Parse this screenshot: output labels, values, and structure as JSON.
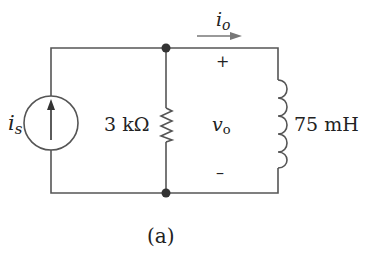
{
  "figure": {
    "caption": "(a)",
    "components": {
      "source": {
        "type": "current-source",
        "label_main": "i",
        "label_sub": "s",
        "direction": "up"
      },
      "resistor": {
        "type": "resistor",
        "label": "3 kΩ"
      },
      "inductor": {
        "type": "inductor",
        "label": "75 mH"
      }
    },
    "current_label": {
      "main": "i",
      "sub": "o"
    },
    "voltage_label": {
      "main": "v",
      "sub": "o",
      "plus": "+",
      "minus": "–"
    },
    "colors": {
      "wire": "#555555",
      "node": "#333333",
      "text": "#222222",
      "arrow": "#777777"
    }
  }
}
